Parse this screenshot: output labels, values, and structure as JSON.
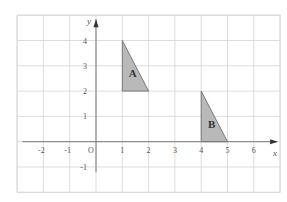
{
  "diagram": {
    "type": "coordinate-grid",
    "x_range": [
      -3,
      7
    ],
    "y_range": [
      -2,
      5
    ],
    "x_axis_label": "x",
    "y_axis_label": "y",
    "origin_label": "O",
    "x_tick_labels": [
      {
        "value": -2,
        "text": "-2"
      },
      {
        "value": -1,
        "text": "-1"
      },
      {
        "value": 1,
        "text": "1"
      },
      {
        "value": 2,
        "text": "2"
      },
      {
        "value": 3,
        "text": "3"
      },
      {
        "value": 4,
        "text": "4"
      },
      {
        "value": 5,
        "text": "5"
      },
      {
        "value": 6,
        "text": "6"
      }
    ],
    "y_tick_labels": [
      {
        "value": 4,
        "text": "4"
      },
      {
        "value": 3,
        "text": "3"
      },
      {
        "value": 2,
        "text": "2"
      },
      {
        "value": 1,
        "text": "1"
      },
      {
        "value": -1,
        "text": "-1"
      }
    ],
    "shapes": [
      {
        "name": "A",
        "vertices": [
          [
            1,
            4
          ],
          [
            1,
            2
          ],
          [
            2,
            2
          ]
        ],
        "label_pos": [
          1.4,
          2.7
        ]
      },
      {
        "name": "B",
        "vertices": [
          [
            4,
            2
          ],
          [
            4,
            0
          ],
          [
            5,
            0
          ]
        ],
        "label_pos": [
          4.4,
          0.7
        ]
      }
    ],
    "colors": {
      "grid": "#d4d4d4",
      "axis": "#7a7a7a",
      "shape_fill": "#b9b9b9",
      "shape_stroke": "#6e6e6e",
      "text": "#555555"
    }
  }
}
